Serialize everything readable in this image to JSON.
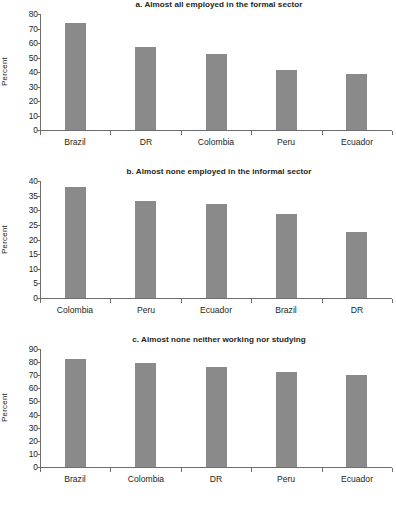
{
  "figure": {
    "panel_count": 3,
    "bar_color": "#8a8a8a",
    "axis_color": "#6d6e71",
    "text_color": "#231f20",
    "background": "#ffffff"
  },
  "chart_data": [
    {
      "id": "panel-a",
      "type": "bar",
      "title": "a. Almost all employed in the formal sector",
      "xlabel": "",
      "ylabel": "Percent",
      "categories": [
        "Brazil",
        "DR",
        "Colombia",
        "Peru",
        "Ecuador"
      ],
      "values": [
        74,
        57,
        52.5,
        41.5,
        38.5
      ],
      "yticks": [
        0,
        10,
        20,
        30,
        40,
        50,
        60,
        70,
        80
      ],
      "ylim": [
        0,
        80
      ],
      "grid": false,
      "legend": false
    },
    {
      "id": "panel-b",
      "type": "bar",
      "title": "b. Almost none employed in the informal sector",
      "xlabel": "",
      "ylabel": "Percent",
      "categories": [
        "Colombia",
        "Peru",
        "Ecuador",
        "Brazil",
        "DR"
      ],
      "values": [
        38,
        33,
        32,
        28.8,
        22.4
      ],
      "yticks": [
        0,
        5,
        10,
        15,
        20,
        25,
        30,
        35,
        40
      ],
      "ylim": [
        0,
        40
      ],
      "grid": false,
      "legend": false
    },
    {
      "id": "panel-c",
      "type": "bar",
      "title": "c. Almost none neither working nor studying",
      "xlabel": "",
      "ylabel": "Percent",
      "categories": [
        "Brazil",
        "Colombia",
        "DR",
        "Peru",
        "Ecuador"
      ],
      "values": [
        82,
        79,
        76,
        72.5,
        70.5
      ],
      "yticks": [
        0,
        10,
        20,
        30,
        40,
        50,
        60,
        70,
        80,
        90
      ],
      "ylim": [
        0,
        90
      ],
      "grid": false,
      "legend": false
    }
  ]
}
